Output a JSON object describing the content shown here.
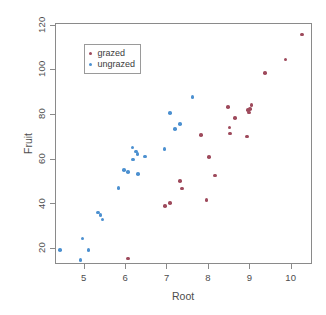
{
  "chart_data": {
    "type": "scatter",
    "title": "",
    "xlabel": "Root",
    "ylabel": "Fruit",
    "xlim": [
      4.3,
      10.5
    ],
    "ylim": [
      13,
      121
    ],
    "xticks": [
      5,
      6,
      7,
      8,
      9,
      10
    ],
    "yticks": [
      20,
      40,
      60,
      80,
      100,
      120
    ],
    "grid": false,
    "legend_position": "top-left",
    "colors": {
      "grazed": "#9e4a5c",
      "ungrazed": "#4c90d0",
      "axis": "#8a8a8a",
      "text": "#4d4d4d"
    },
    "series": [
      {
        "name": "grazed",
        "color": "#9e4a5c",
        "points": [
          [
            6.08,
            15.3
          ],
          [
            6.96,
            38.7
          ],
          [
            7.08,
            40.2
          ],
          [
            7.33,
            50.1
          ],
          [
            7.37,
            46.6
          ],
          [
            7.83,
            70.5
          ],
          [
            7.97,
            41.5
          ],
          [
            8.03,
            60.6
          ],
          [
            8.17,
            52.4
          ],
          [
            8.48,
            83.0
          ],
          [
            8.52,
            74.0
          ],
          [
            8.54,
            71.2
          ],
          [
            8.66,
            78.2
          ],
          [
            8.95,
            70.0
          ],
          [
            8.97,
            81.9
          ],
          [
            9.02,
            82.3
          ],
          [
            9.05,
            84.1
          ],
          [
            8.99,
            80.7
          ],
          [
            9.38,
            98.5
          ],
          [
            9.87,
            104.5
          ],
          [
            10.27,
            115.6
          ]
        ]
      },
      {
        "name": "ungrazed",
        "color": "#4c90d0",
        "points": [
          [
            4.43,
            19.0
          ],
          [
            4.93,
            14.7
          ],
          [
            4.98,
            24.2
          ],
          [
            5.12,
            19.0
          ],
          [
            5.35,
            35.9
          ],
          [
            5.41,
            34.8
          ],
          [
            5.46,
            32.8
          ],
          [
            5.84,
            46.9
          ],
          [
            5.97,
            54.8
          ],
          [
            6.07,
            53.9
          ],
          [
            6.18,
            64.9
          ],
          [
            6.2,
            59.6
          ],
          [
            6.27,
            63.2
          ],
          [
            6.3,
            62.0
          ],
          [
            6.32,
            53.1
          ],
          [
            6.49,
            60.9
          ],
          [
            6.95,
            64.3
          ],
          [
            7.09,
            80.5
          ],
          [
            7.21,
            73.3
          ],
          [
            7.33,
            75.5
          ],
          [
            7.63,
            87.7
          ]
        ]
      }
    ]
  },
  "legend": {
    "entries": [
      {
        "label": "grazed",
        "color": "#9e4a5c"
      },
      {
        "label": "ungrazed",
        "color": "#4c90d0"
      }
    ]
  },
  "axes": {
    "x_title": "Root",
    "y_title": "Fruit",
    "x_tick_labels": [
      "5",
      "6",
      "7",
      "8",
      "9",
      "10"
    ],
    "y_tick_labels": [
      "20",
      "40",
      "60",
      "80",
      "100",
      "120"
    ]
  }
}
